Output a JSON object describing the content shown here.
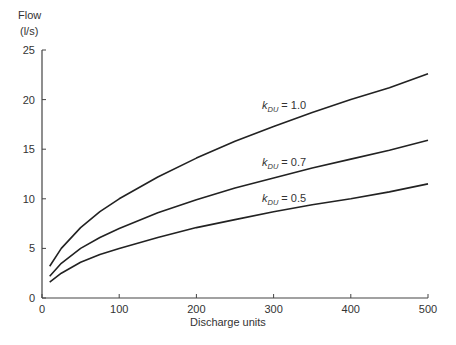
{
  "chart_data": {
    "type": "line",
    "title": "",
    "ylabel_line1": "Flow",
    "ylabel_line2": "(l/s)",
    "xlabel": "Discharge units",
    "xlim": [
      0,
      500
    ],
    "ylim": [
      0,
      25
    ],
    "xticks": [
      0,
      100,
      200,
      300,
      400,
      500
    ],
    "yticks": [
      0,
      5,
      10,
      15,
      20,
      25
    ],
    "grid": false,
    "legend": "inline labels",
    "x": [
      10,
      25,
      50,
      75,
      100,
      150,
      200,
      250,
      300,
      350,
      400,
      450,
      500
    ],
    "series": [
      {
        "name": "k_DU = 1.0",
        "label_k": "k",
        "label_sub": "DU",
        "label_val": "= 1.0",
        "values": [
          3.2,
          5.0,
          7.1,
          8.7,
          10.0,
          12.2,
          14.1,
          15.8,
          17.3,
          18.7,
          20.0,
          21.2,
          22.6
        ]
      },
      {
        "name": "k_DU = 0.7",
        "label_k": "k",
        "label_sub": "DU",
        "label_val": "= 0.7",
        "values": [
          2.2,
          3.5,
          5.0,
          6.1,
          7.0,
          8.6,
          9.9,
          11.1,
          12.1,
          13.1,
          14.0,
          14.9,
          15.9
        ]
      },
      {
        "name": "k_DU = 0.5",
        "label_k": "k",
        "label_sub": "DU",
        "label_val": "= 0.5",
        "values": [
          1.6,
          2.5,
          3.6,
          4.4,
          5.0,
          6.1,
          7.1,
          7.9,
          8.7,
          9.4,
          10.0,
          10.7,
          11.5
        ]
      }
    ]
  }
}
